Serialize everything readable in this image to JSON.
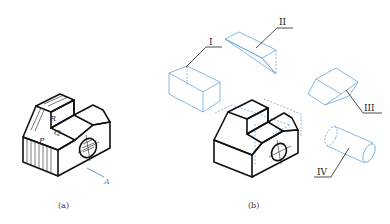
{
  "figure_a": {
    "caption": "(a)",
    "face_labels": {
      "P": "P",
      "Q": "Q",
      "R": "R"
    },
    "view_arrow_label": "A"
  },
  "figure_b": {
    "caption": "(b)",
    "parts": [
      {
        "id": "I",
        "label": "I",
        "shape": "rectangular block"
      },
      {
        "id": "II",
        "label": "II",
        "shape": "triangular prism wedge"
      },
      {
        "id": "III",
        "label": "III",
        "shape": "trapezoidal prism"
      },
      {
        "id": "IV",
        "label": "IV",
        "shape": "cylinder"
      }
    ]
  },
  "colors": {
    "outline": "#111111",
    "construction": "#6aa6dc",
    "arrow": "#5b8fc7"
  }
}
